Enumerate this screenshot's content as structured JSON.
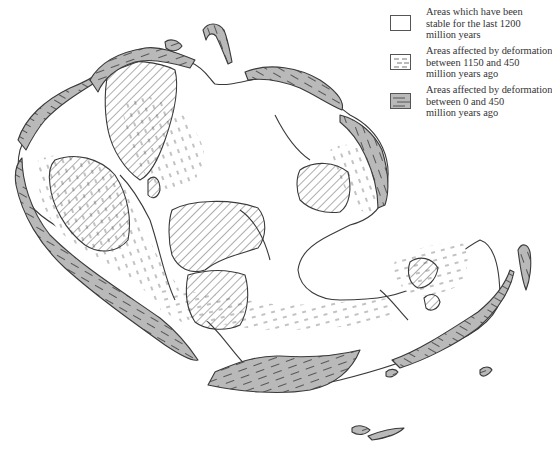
{
  "legend": {
    "items": [
      {
        "id": "stable",
        "lines": [
          "Areas which have been",
          "stable for the last 1200",
          "million years"
        ],
        "swatch": "blank",
        "fill": "#ffffff"
      },
      {
        "id": "deformed-1150-450",
        "lines": [
          "Areas affected by deformation",
          "between 1150 and 450",
          "million years ago"
        ],
        "swatch": "dashed-white",
        "fill": "#ffffff"
      },
      {
        "id": "deformed-0-450",
        "lines": [
          "Areas affected by deformation",
          "between 0 and 450",
          "million years ago"
        ],
        "swatch": "dashed-grey",
        "fill": "#b9b9b9"
      }
    ]
  },
  "map": {
    "description": "Reconstruction of continental assembly showing stable cratons (hatched), older deformation belts (white with dashes) and young deformation belts (grey with dashes)",
    "colors": {
      "young_belt": "#b9b9b9",
      "outline": "#3a3a3a",
      "hatch": "#4a4a4a",
      "background": "#ffffff"
    },
    "region_types": [
      "hatched-craton",
      "white-dashed-belt",
      "grey-dashed-belt"
    ]
  }
}
